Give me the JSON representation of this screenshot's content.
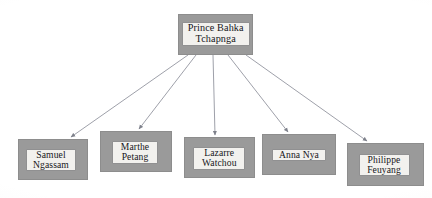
{
  "diagram": {
    "type": "hierarchy-tree",
    "background_color": "#ffffff",
    "node_fill_color": "#9a9a9a",
    "node_border_color": "#8d8d8d",
    "label_fill_color": "#f2f1ee",
    "label_text_color": "#16161a",
    "connector_color": "#8c8f99",
    "root": {
      "id": "root",
      "name": "root-node",
      "label": "Prince Bahka\nTchapnga",
      "line1": "Prince Bahka",
      "line2": "Tchapnga",
      "box": {
        "x": 178,
        "y": 14,
        "w": 75,
        "h": 41
      },
      "label_box": {
        "x": 185,
        "y": 21,
        "w": 62,
        "h": 26
      }
    },
    "children": [
      {
        "id": "child-1",
        "name": "child-node-samuel-ngassam",
        "label": "Samuel\nNgassam",
        "line1": "Samuel",
        "line2": "Ngassam",
        "box": {
          "x": 18,
          "y": 139,
          "w": 70,
          "h": 41
        },
        "label_box": {
          "x": 27,
          "y": 148,
          "w": 44,
          "h": 25
        }
      },
      {
        "id": "child-2",
        "name": "child-node-marthe-petang",
        "label": "Marthe\nPetang",
        "line1": "Marthe",
        "line2": "Petang",
        "box": {
          "x": 100,
          "y": 131,
          "w": 72,
          "h": 41
        },
        "label_box": {
          "x": 114,
          "y": 141,
          "w": 40,
          "h": 25
        }
      },
      {
        "id": "child-3",
        "name": "child-node-lazarre-watchou",
        "label": "Lazarre\nWatchou",
        "line1": "Lazarre",
        "line2": "Watchou",
        "box": {
          "x": 184,
          "y": 137,
          "w": 71,
          "h": 41
        },
        "label_box": {
          "x": 196,
          "y": 147,
          "w": 46,
          "h": 25
        }
      },
      {
        "id": "child-4",
        "name": "child-node-anna-nya",
        "label": "Anna Nya",
        "line1": "Anna Nya",
        "line2": "",
        "box": {
          "x": 262,
          "y": 134,
          "w": 74,
          "h": 41
        },
        "label_box": {
          "x": 275,
          "y": 149,
          "w": 48,
          "h": 13
        }
      },
      {
        "id": "child-5",
        "name": "child-node-philippe-feuyang",
        "label": "Philippe\nFeuyang",
        "line1": "Philippe",
        "line2": "Feuyang",
        "box": {
          "x": 347,
          "y": 143,
          "w": 77,
          "h": 43
        },
        "label_box": {
          "x": 360,
          "y": 153,
          "w": 45,
          "h": 25
        }
      }
    ],
    "connectors": [
      {
        "id": "edge-1",
        "name": "connector-root-to-samuel-ngassam",
        "from": "root",
        "to": "child-1",
        "x1": 188,
        "y1": 55,
        "x2": 71,
        "y2": 137
      },
      {
        "id": "edge-2",
        "name": "connector-root-to-marthe-petang",
        "from": "root",
        "to": "child-2",
        "x1": 196,
        "y1": 55,
        "x2": 139,
        "y2": 129
      },
      {
        "id": "edge-3",
        "name": "connector-root-to-lazarre-watchou",
        "from": "root",
        "to": "child-3",
        "x1": 213,
        "y1": 55,
        "x2": 215,
        "y2": 135
      },
      {
        "id": "edge-4",
        "name": "connector-root-to-anna-nya",
        "from": "root",
        "to": "child-4",
        "x1": 228,
        "y1": 55,
        "x2": 288,
        "y2": 132
      },
      {
        "id": "edge-5",
        "name": "connector-root-to-philippe-feuyang",
        "from": "root",
        "to": "child-5",
        "x1": 246,
        "y1": 55,
        "x2": 367,
        "y2": 141
      }
    ]
  }
}
